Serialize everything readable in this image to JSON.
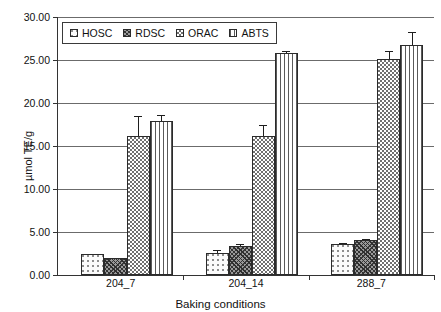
{
  "chart_data": {
    "type": "bar",
    "title": "",
    "xlabel": "Baking conditions",
    "ylabel": "µmol TE/g",
    "ylim": [
      0,
      30
    ],
    "ytick_step": 5,
    "ytick_labels": [
      "0.00",
      "5.00",
      "10.00",
      "15.00",
      "20.00",
      "25.00",
      "30.00"
    ],
    "ytick_values": [
      0,
      5,
      10,
      15,
      20,
      25,
      30
    ],
    "grid": true,
    "grid_axis": "y",
    "legend_position": "top-left-inside",
    "categories": [
      "204_7",
      "204_14",
      "288_7"
    ],
    "series": [
      {
        "name": "HOSC",
        "pattern": "light-dotted",
        "values": [
          2.5,
          2.6,
          3.6
        ],
        "errors": [
          0.0,
          0.3,
          0.15
        ]
      },
      {
        "name": "RDSC",
        "pattern": "dark-diagonal-crosshatch",
        "values": [
          2.0,
          3.4,
          4.1
        ],
        "errors": [
          0.0,
          0.2,
          0.1
        ]
      },
      {
        "name": "ORAC",
        "pattern": "checkerboard",
        "values": [
          16.2,
          16.2,
          25.1
        ],
        "errors": [
          2.3,
          1.3,
          0.9
        ]
      },
      {
        "name": "ABTS",
        "pattern": "vertical-stripes",
        "values": [
          17.9,
          25.8,
          26.8
        ],
        "errors": [
          0.7,
          0.2,
          1.5
        ]
      }
    ]
  },
  "legend": {
    "items": [
      {
        "label": "HOSC"
      },
      {
        "label": "RDSC"
      },
      {
        "label": "ORAC"
      },
      {
        "label": "ABTS"
      }
    ]
  },
  "colors": {
    "axis": "#333333",
    "gridline": "#6b6b6b",
    "bar_outline": "#2b2b2b",
    "error_bar": "#1e1e1e",
    "background": "#ffffff"
  }
}
